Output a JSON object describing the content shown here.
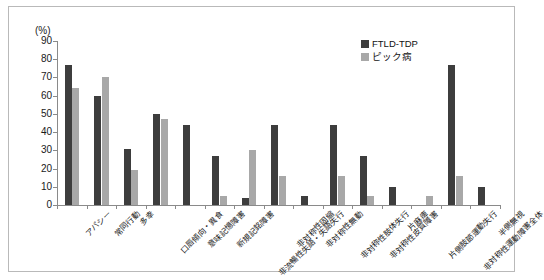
{
  "axis": {
    "unit_label": "(%)",
    "y_ticks": [
      0,
      10,
      20,
      30,
      40,
      50,
      60,
      70,
      80,
      90
    ]
  },
  "legend": {
    "items": [
      {
        "label": "FTLD-TDP",
        "color": "#3d3d3d"
      },
      {
        "label": "ピック病",
        "color": "#a8a8a8"
      }
    ]
  },
  "chart_data": {
    "type": "bar",
    "title": "",
    "xlabel": "",
    "ylabel": "(%)",
    "ylim": [
      0,
      90
    ],
    "grid": false,
    "legend_position": "top-right",
    "categories": [
      "アパシー",
      "常同行動",
      "多幸",
      "口唇傾向・異食",
      "意味記憶障害",
      "新規記銘障害",
      "非流暢性失語・失語失行",
      "非対称性固縮",
      "非対称性無動",
      "非対称性肢体失行",
      "非対称性皮質障害",
      "片麻痺",
      "片側肢節運動失行",
      "非対称性運動障害全体",
      "半側無視"
    ],
    "series": [
      {
        "name": "FTLD-TDP",
        "color": "#3d3d3d",
        "values": [
          77,
          60,
          31,
          50,
          44,
          27,
          4,
          44,
          5,
          44,
          27,
          10,
          0,
          77,
          10
        ]
      },
      {
        "name": "ピック病",
        "color": "#a8a8a8",
        "values": [
          64,
          70,
          19,
          47,
          0,
          5,
          30,
          16,
          0,
          16,
          5,
          0,
          5,
          16,
          0
        ]
      }
    ]
  }
}
